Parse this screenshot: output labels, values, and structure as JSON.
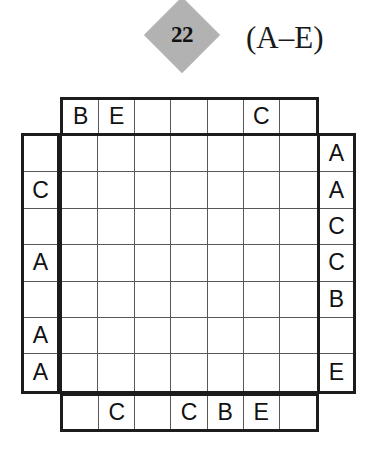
{
  "header": {
    "puzzle_number": "22",
    "range_label": "(A–E)",
    "badge_color": "#b2b2b2"
  },
  "grid": {
    "size": 7,
    "letters": "A-E",
    "top_clues": [
      "B",
      "E",
      "",
      "",
      "",
      "C",
      ""
    ],
    "bottom_clues": [
      "",
      "C",
      "",
      "C",
      "B",
      "E",
      ""
    ],
    "left_clues": [
      "",
      "C",
      "",
      "A",
      "",
      "A",
      "A"
    ],
    "right_clues": [
      "A",
      "A",
      "C",
      "C",
      "B",
      "",
      "E"
    ],
    "cells": [
      [
        "",
        "",
        "",
        "",
        "",
        "",
        ""
      ],
      [
        "",
        "",
        "",
        "",
        "",
        "",
        ""
      ],
      [
        "",
        "",
        "",
        "",
        "",
        "",
        ""
      ],
      [
        "",
        "",
        "",
        "",
        "",
        "",
        ""
      ],
      [
        "",
        "",
        "",
        "",
        "",
        "",
        ""
      ],
      [
        "",
        "",
        "",
        "",
        "",
        "",
        ""
      ],
      [
        "",
        "",
        "",
        "",
        "",
        "",
        ""
      ]
    ]
  }
}
